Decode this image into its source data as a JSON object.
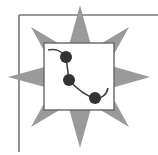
{
  "icon": {
    "semantic": "graph-curve-with-points-star-badge",
    "colors": {
      "background": "#ffffff",
      "frame": "#777777",
      "star": "#9a9a9a",
      "square_fill": "#ffffff",
      "square_border": "#666666",
      "curve": "#444444",
      "points": "#333333"
    },
    "points": [
      {
        "x": 66,
        "y": 57
      },
      {
        "x": 69,
        "y": 80
      },
      {
        "x": 95,
        "y": 98
      }
    ]
  }
}
